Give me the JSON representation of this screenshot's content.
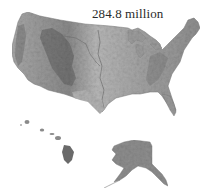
{
  "figure": {
    "caption": "284.8 million",
    "type": "shaded-relief map",
    "regions": [
      {
        "name": "Contiguous United States"
      },
      {
        "name": "Hawaii"
      },
      {
        "name": "Alaska"
      }
    ],
    "colors": {
      "background": "#ffffff",
      "land_light": "#c8c8c8",
      "land_mid": "#9a9a9a",
      "land_dark": "#5e5e5e",
      "text": "#2a2a2a"
    }
  }
}
